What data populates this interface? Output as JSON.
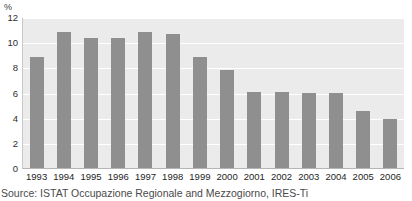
{
  "chart_data": {
    "type": "bar",
    "title": "",
    "subtitle": "",
    "xlabel": "",
    "ylabel": "%",
    "categories": [
      "1993",
      "1994",
      "1995",
      "1996",
      "1997",
      "1998",
      "1999",
      "2000",
      "2001",
      "2002",
      "2003",
      "2004",
      "2005",
      "2006"
    ],
    "values": [
      8.9,
      10.9,
      10.4,
      10.4,
      10.9,
      10.7,
      8.9,
      7.9,
      6.1,
      6.1,
      6.0,
      6.0,
      4.6,
      4.0
    ],
    "ylim": [
      0,
      12
    ],
    "yticks": [
      0,
      2,
      4,
      6,
      8,
      10,
      12
    ],
    "ytick_labels": [
      "0",
      "2",
      "4",
      "6",
      "8",
      "10",
      "12"
    ],
    "grid": true,
    "grid_axis": "y",
    "legend": false,
    "legend_position": "none",
    "bar_color": "#8f8f8f",
    "plot_background": "#ebebeb",
    "gridline_color": "#ffffff",
    "annotations": []
  },
  "caption": {
    "source_text": "Source: ISTAT Occupazione Regionale and Mezzogiorno, IRES-Ti"
  },
  "colors": {
    "bar": "#8f8f8f",
    "plot_bg": "#ebebeb",
    "grid": "#ffffff",
    "axis": "#b5b5b5",
    "text": "#1e1e1e"
  }
}
